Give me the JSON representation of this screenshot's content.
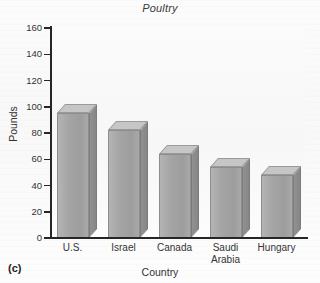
{
  "figure": {
    "panel_label": "(c)",
    "background_color": "#fdfdfd"
  },
  "chart_data": {
    "type": "bar",
    "title": "Poultry",
    "xlabel": "Country",
    "ylabel": "Pounds",
    "categories": [
      "U.S.",
      "Israel",
      "Canada",
      "Saudi Arabia",
      "Hungary"
    ],
    "values": [
      95,
      82,
      64,
      54,
      48
    ],
    "ylim": [
      0,
      160
    ],
    "yticks": [
      0,
      20,
      40,
      60,
      80,
      100,
      120,
      140,
      160
    ],
    "ytick_labels": [
      "0",
      "20",
      "40",
      "60",
      "80",
      "100",
      "120",
      "140",
      "160"
    ],
    "grid": false,
    "legend": null,
    "bar_style": "3d-block",
    "bar_face_color": "#a5a5a5",
    "bar_top_color": "#c6c6c6",
    "bar_side_color": "#8c8c8c",
    "axis_color": "#262626"
  },
  "x_labels": [
    {
      "line1": "U.S.",
      "line2": ""
    },
    {
      "line1": "Israel",
      "line2": ""
    },
    {
      "line1": "Canada",
      "line2": ""
    },
    {
      "line1": "Saudi",
      "line2": "Arabia"
    },
    {
      "line1": "Hungary",
      "line2": ""
    }
  ]
}
